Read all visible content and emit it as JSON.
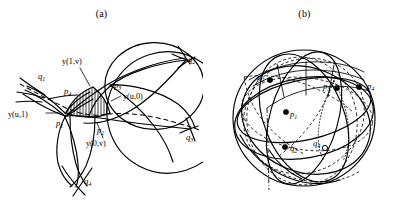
{
  "figure": {
    "panels": [
      {
        "id": "a",
        "caption": "(a)",
        "point_labels": [
          {
            "name": "p1",
            "base": "p",
            "sub": "1"
          },
          {
            "name": "p2",
            "base": "p",
            "sub": "2"
          },
          {
            "name": "p3",
            "base": "p",
            "sub": "3"
          },
          {
            "name": "p4",
            "base": "p",
            "sub": "4"
          },
          {
            "name": "q1",
            "base": "q",
            "sub": "1"
          },
          {
            "name": "q2",
            "base": "q",
            "sub": "2"
          },
          {
            "name": "q3",
            "base": "q",
            "sub": "3"
          },
          {
            "name": "q4",
            "base": "q",
            "sub": "4"
          }
        ],
        "curve_labels": [
          {
            "name": "y-1-v",
            "text": "y(1,v)"
          },
          {
            "name": "y-u-0",
            "text": "y(u,0)"
          },
          {
            "name": "y-u-1",
            "text": "y(u,1)"
          },
          {
            "name": "y-0-v",
            "text": "y(0,v)"
          }
        ]
      },
      {
        "id": "b",
        "caption": "(b)",
        "point_labels": [
          {
            "name": "p1",
            "base": "p",
            "sub": "1"
          },
          {
            "name": "p2",
            "base": "p",
            "sub": "2"
          },
          {
            "name": "p3",
            "base": "p",
            "sub": "3"
          },
          {
            "name": "p4",
            "base": "p",
            "sub": "4"
          },
          {
            "name": "q2",
            "base": "q",
            "sub": "2"
          },
          {
            "name": "q4",
            "base": "q",
            "sub": "4"
          }
        ]
      }
    ],
    "colors": {
      "ink": "#000000",
      "background": "#ffffff"
    }
  }
}
